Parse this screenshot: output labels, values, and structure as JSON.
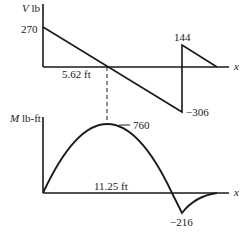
{
  "shear_diagram": {
    "axis_label_var": "V",
    "axis_label_unit": " lb",
    "x_axis_label": "x",
    "max_value_label": "270",
    "jump_value_label": "144",
    "min_value_label": "−306",
    "zero_crossing_label": "5.62 ft",
    "values": {
      "start": 270,
      "before_jump": -306,
      "after_jump": 144,
      "end": 0,
      "zero_crossing_ft": 5.62
    }
  },
  "moment_diagram": {
    "axis_label_var": "M",
    "axis_label_unit": " lb-ft",
    "x_axis_label": "x",
    "max_value_label": "760",
    "min_value_label": "−216",
    "zero_crossing_label": "11.25 ft",
    "values": {
      "start": 0,
      "max": 760,
      "max_at_ft": 5.62,
      "zero_crossing_ft": 11.25,
      "min": -216,
      "end": 0
    }
  },
  "colors": {
    "ink": "#1a1a1a"
  }
}
